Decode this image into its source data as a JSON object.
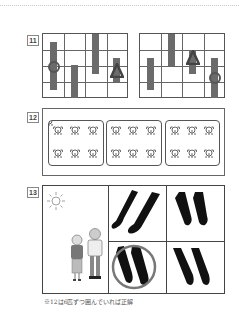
{
  "page": {
    "top_rule": "dotted-divider"
  },
  "questions": [
    {
      "number": "11",
      "grids": [
        {
          "cols": 4,
          "rows": 4,
          "items": [
            {
              "col": 1,
              "type": "bar",
              "marker": "circle"
            },
            {
              "col": 2,
              "type": "bar"
            },
            {
              "col": 3,
              "type": "bar"
            },
            {
              "col": 4,
              "type": "bar",
              "marker": "triangle"
            }
          ]
        },
        {
          "cols": 4,
          "rows": 4,
          "items": [
            {
              "col": 1,
              "type": "bar"
            },
            {
              "col": 2,
              "type": "bar"
            },
            {
              "col": 3,
              "type": "bar",
              "marker": "triangle"
            },
            {
              "col": 4,
              "type": "bar",
              "marker": "circle"
            }
          ]
        }
      ]
    },
    {
      "number": "12",
      "groups": [
        {
          "count": 6,
          "icon": "animal-face-icon"
        },
        {
          "count": 6,
          "icon": "animal-face-icon"
        },
        {
          "count": 6,
          "icon": "animal-face-icon"
        }
      ]
    },
    {
      "number": "13",
      "left_panel": {
        "icons": [
          "sun-icon",
          "grandmother-figure",
          "grandfather-figure"
        ]
      },
      "shadow_panels": [
        {
          "position": "top-left",
          "circled": false
        },
        {
          "position": "top-right",
          "circled": false
        },
        {
          "position": "bottom-left",
          "circled": true
        },
        {
          "position": "bottom-right",
          "circled": false
        }
      ]
    }
  ],
  "footnote": "※12は6匹ずつ囲んでいれば正解",
  "colors": {
    "bar": "#6b6b6b",
    "line": "#555555",
    "shadow": "#111111",
    "answer_circle": "#777777"
  }
}
